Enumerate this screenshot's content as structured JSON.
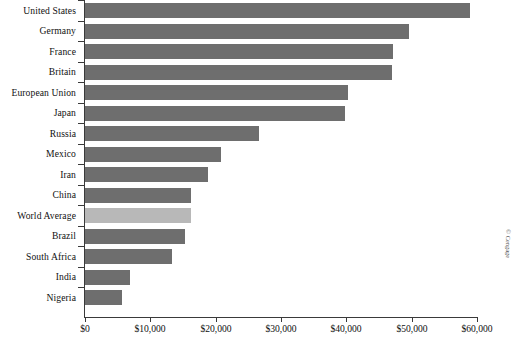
{
  "credit": "© Cengage",
  "chart_data": {
    "type": "bar",
    "orientation": "horizontal",
    "title": "",
    "xlabel": "",
    "ylabel": "",
    "xlim": [
      0,
      60000
    ],
    "grid": false,
    "legend": null,
    "tick_labels": [
      "$0",
      "$10,000",
      "$20,000",
      "$30,000",
      "$40,000",
      "$50,000",
      "$60,000"
    ],
    "tick_values": [
      0,
      10000,
      20000,
      30000,
      40000,
      50000,
      60000
    ],
    "highlight_category": "World Average",
    "colors": {
      "bar": "#6e6e6e",
      "highlight_bar": "#b8b8b8",
      "axis": "#3a3a3a",
      "text": "#111111",
      "background": "#ffffff"
    },
    "categories": [
      "United States",
      "Germany",
      "France",
      "Britain",
      "European Union",
      "Japan",
      "Russia",
      "Mexico",
      "Iran",
      "China",
      "World Average",
      "Brazil",
      "South Africa",
      "India",
      "Nigeria"
    ],
    "values": [
      58900,
      49600,
      47200,
      47000,
      40300,
      39800,
      26600,
      20800,
      18800,
      16200,
      16200,
      15300,
      13300,
      6900,
      5600
    ]
  }
}
